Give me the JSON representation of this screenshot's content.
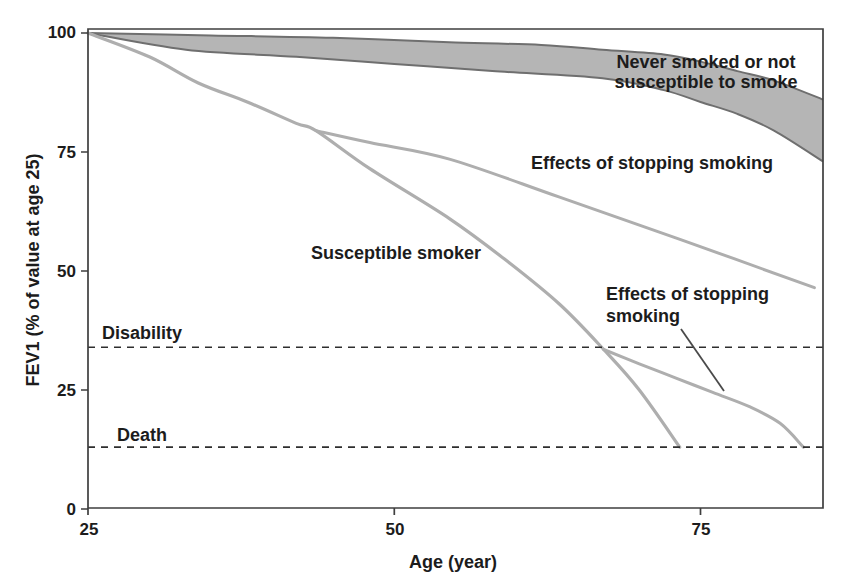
{
  "figure": {
    "background": "#ffffff",
    "frame_color": "#3f3f3f",
    "curve_color": "#aeaeae",
    "band_fill": "#b5b5b5",
    "band_edge": "#6f6f6f",
    "dash_color": "#2e2e2e",
    "pointer_color": "#4a4a4a",
    "text_color": "#1c1c1c"
  },
  "axes": {
    "x_label": "Age (year)",
    "y_label": "FEV1 (% of value at age 25)",
    "x_tick_labels": [
      "25",
      "50",
      "75"
    ],
    "y_tick_labels": [
      "100",
      "75",
      "50",
      "25",
      "0"
    ]
  },
  "annotations": {
    "never_smoked": {
      "line1": "Never smoked or not",
      "line2": "susceptible to smoke"
    },
    "effects_top": "Effects of stopping smoking",
    "susceptible": "Susceptible smoker",
    "effects_bottom": {
      "line1": "Effects of stopping",
      "line2": "smoking"
    },
    "disability": "Disability",
    "death": "Death"
  },
  "chart_data": {
    "type": "line",
    "title": "",
    "xlabel": "Age (year)",
    "ylabel": "FEV1 (% of value at age 25)",
    "xlim": [
      25,
      85
    ],
    "ylim": [
      0,
      100
    ],
    "x_ticks": [
      25,
      50,
      75
    ],
    "y_ticks": [
      100,
      75,
      50,
      25,
      0
    ],
    "grid": false,
    "legend": "inline text annotations",
    "band": {
      "name": "Never smoked or not susceptible to smoke",
      "ages_upper": [
        25,
        35,
        45,
        55,
        62,
        67,
        72,
        75,
        78,
        81,
        85
      ],
      "upper": [
        100,
        99.5,
        99,
        98,
        97.5,
        96.5,
        95.5,
        94,
        92,
        90,
        86
      ],
      "ages_lower": [
        25,
        33,
        42,
        50,
        58,
        67,
        72,
        75,
        78,
        81,
        85
      ],
      "lower": [
        100,
        96.5,
        95,
        93.5,
        92,
        90.5,
        88,
        85.5,
        83,
        79.5,
        73
      ]
    },
    "series": [
      {
        "name": "Susceptible smoker",
        "ages": [
          25,
          30,
          34,
          38,
          42,
          43.6,
          48,
          54.5,
          59,
          63.5,
          67.1,
          70,
          73.3
        ],
        "values": [
          100,
          95,
          89.5,
          85.5,
          81,
          79.5,
          71.5,
          61,
          52.5,
          43,
          33.5,
          25,
          13
        ]
      },
      {
        "name": "Effects of stopping smoking (stopped ~age 44)",
        "ages": [
          43.6,
          48,
          54.5,
          63.5,
          73.5,
          84.3
        ],
        "values": [
          79.5,
          77,
          73.5,
          65.5,
          56.5,
          46.5
        ]
      },
      {
        "name": "Effects of stopping smoking (stopped ~age 67)",
        "ages": [
          67.1,
          70,
          73,
          76,
          79,
          81.5,
          83.4
        ],
        "values": [
          33.5,
          30.5,
          27.5,
          24.5,
          21.5,
          18,
          13
        ]
      }
    ],
    "reference_lines": [
      {
        "label": "Disability",
        "value": 34
      },
      {
        "label": "Death",
        "value": 13
      }
    ]
  }
}
